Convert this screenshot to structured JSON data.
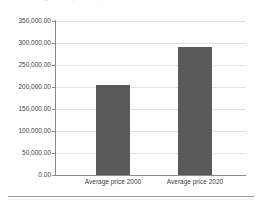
{
  "header": {
    "cut_off_title": "Average house price comparison"
  },
  "chart_data": {
    "type": "bar",
    "title": "",
    "xlabel": "",
    "ylabel": "",
    "categories": [
      "Average price 2000",
      "Average price 2020"
    ],
    "values": [
      205000,
      292000
    ],
    "ylim": [
      0,
      350000
    ],
    "ytick_values": [
      0,
      50000,
      100000,
      150000,
      200000,
      250000,
      300000,
      350000
    ],
    "ytick_labels": [
      "0.00",
      "50,000.00",
      "100,000.00",
      "150,000.00",
      "200,000.00",
      "250,000.00",
      "300,000.00",
      "350,000.00"
    ],
    "grid": true,
    "legend": false,
    "series": [
      {
        "name": "Average price",
        "values": [
          205000,
          292000
        ]
      }
    ],
    "colors": {
      "bar": "#595959",
      "gridline": "#e2e2e2",
      "axis": "#8a8a8a",
      "text": "#404040",
      "background": "#ffffff"
    }
  }
}
